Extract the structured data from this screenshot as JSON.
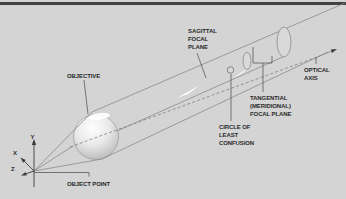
{
  "labels": {
    "objective": "OBJECTIVE",
    "object_point": "OBJECT POINT",
    "sagittal_focal_plane": [
      "SAGITTAL",
      "FOCAL",
      "PLANE"
    ],
    "tangential_focal_plane": [
      "TANGENTIAL",
      "(MERIDIONAL)",
      "FOCAL PLANE"
    ],
    "circle_of_least_confusion": [
      "CIRCLE OF",
      "LEAST",
      "CONFUSION"
    ],
    "optical_axis": [
      "OPTICAL",
      "AXIS"
    ],
    "axes": {
      "x": "X",
      "y": "Y",
      "z": "Z"
    }
  },
  "colors": {
    "background": "#d4d4d4",
    "top_bar": "#424242",
    "diagram_line": "#8a8a8a",
    "leader_line": "#5a5a5a",
    "text": "#2a2a2a",
    "focal_highlight": "#ffffff",
    "sphere_highlight": "#ffffff",
    "sphere_shadow": "#a8a8a8"
  }
}
